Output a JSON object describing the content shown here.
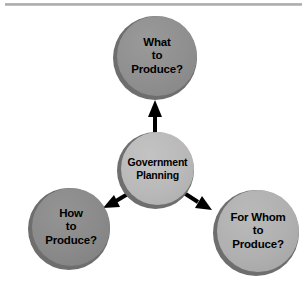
{
  "diagram": {
    "title_rule": "horizontal-divider",
    "background_color": "#ffffff",
    "nodes": [
      {
        "id": "what-to-produce",
        "label": "What\nto\nProduce?",
        "role": "outcome",
        "fill_color": "#8f8f8f",
        "shadow_color": "#6e6e6e",
        "text_color": "#000000",
        "position": "top"
      },
      {
        "id": "government-planning",
        "label": "Government\nPlanning",
        "role": "source",
        "fill_color": "#b9b9b9",
        "shadow_color": "#6e6e6e",
        "text_color": "#000000",
        "position": "center"
      },
      {
        "id": "how-to-produce",
        "label": "How\nto\nProduce?",
        "role": "outcome",
        "fill_color": "#8a8a8a",
        "shadow_color": "#6e6e6e",
        "text_color": "#000000",
        "position": "bottom-left"
      },
      {
        "id": "for-whom-to-produce",
        "label": "For Whom\nto\nProduce?",
        "role": "outcome",
        "fill_color": "#b0b0b0",
        "shadow_color": "#6e6e6e",
        "text_color": "#000000",
        "position": "bottom-right"
      }
    ],
    "connectors": [
      {
        "id": "arrow-up",
        "from": "government-planning",
        "to": "what-to-produce",
        "direction": "up",
        "color": "#000000"
      },
      {
        "id": "arrow-down-left",
        "from": "government-planning",
        "to": "how-to-produce",
        "direction": "down-left",
        "color": "#000000"
      },
      {
        "id": "arrow-down-right",
        "from": "government-planning",
        "to": "for-whom-to-produce",
        "direction": "down-right",
        "color": "#000000"
      }
    ]
  }
}
